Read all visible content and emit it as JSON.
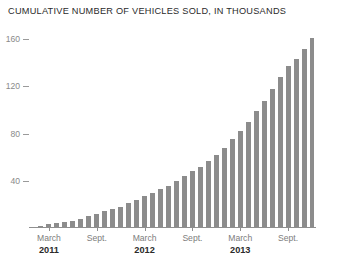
{
  "chart_data": {
    "type": "bar",
    "title": "CUMULATIVE NUMBER OF VEHICLES SOLD, IN THOUSANDS",
    "xlabel": "",
    "ylabel": "",
    "ylim": [
      0,
      172
    ],
    "yticks": [
      40,
      80,
      120,
      160
    ],
    "ytick_labels": [
      "40",
      "80",
      "120",
      "160"
    ],
    "grid": false,
    "legend": null,
    "bar_color": "#8c8c8c",
    "axis_color": "#8f8f8f",
    "categories": [
      "Jan 2011",
      "Feb 2011",
      "March 2011",
      "Apr 2011",
      "May 2011",
      "June 2011",
      "July 2011",
      "Aug 2011",
      "Sept. 2011",
      "Oct 2011",
      "Nov 2011",
      "Dec 2011",
      "Jan 2012",
      "Feb 2012",
      "March 2012",
      "Apr 2012",
      "May 2012",
      "June 2012",
      "July 2012",
      "Aug 2012",
      "Sept. 2012",
      "Oct 2012",
      "Nov 2012",
      "Dec 2012",
      "Jan 2013",
      "Feb 2013",
      "March 2013",
      "Apr 2013",
      "May 2013",
      "June 2013",
      "July 2013",
      "Aug 2013",
      "Sept. 2013",
      "Oct 2013",
      "Nov 2013",
      "Dec 2013"
    ],
    "values": [
      1,
      2,
      3,
      4,
      5,
      6,
      8,
      10,
      12,
      14,
      16,
      18,
      21,
      24,
      27,
      30,
      33,
      36,
      40,
      44,
      48,
      52,
      57,
      62,
      68,
      75,
      82,
      90,
      99,
      108,
      118,
      128,
      137,
      143,
      152,
      161
    ],
    "x_tick_labels": [
      {
        "label": "March",
        "index": 2
      },
      {
        "label": "Sept.",
        "index": 8
      },
      {
        "label": "March",
        "index": 14
      },
      {
        "label": "Sept.",
        "index": 20
      },
      {
        "label": "March",
        "index": 26
      },
      {
        "label": "Sept.",
        "index": 32
      }
    ],
    "x_year_labels": [
      {
        "label": "2011",
        "index": 2
      },
      {
        "label": "2012",
        "index": 14
      },
      {
        "label": "2013",
        "index": 26
      }
    ]
  }
}
